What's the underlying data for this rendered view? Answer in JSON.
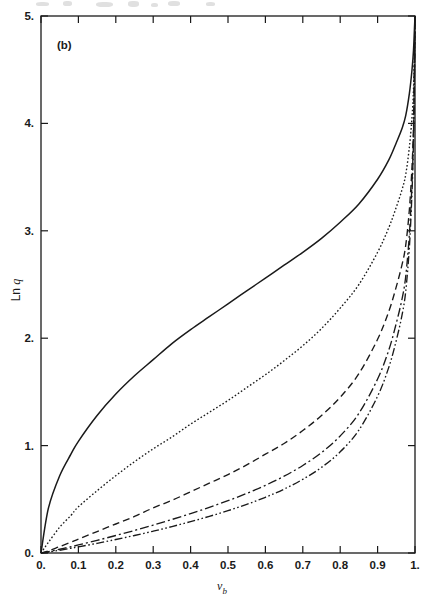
{
  "figure": {
    "panel_label": "(b)",
    "background_color": "#ffffff",
    "line_color": "#1a1a1a",
    "frame": {
      "left": 41,
      "top": 16,
      "right": 415,
      "bottom": 553
    }
  },
  "chart_data": {
    "type": "line",
    "title": "",
    "panel": "(b)",
    "xlabel": "v_b",
    "xlabel_base": "v",
    "xlabel_sub": "b",
    "ylabel": "Ln q",
    "ylabel_base": "Ln ",
    "ylabel_italic": "q",
    "xlim": [
      0,
      1
    ],
    "ylim": [
      0,
      5
    ],
    "xticks": [
      0,
      0.1,
      0.2,
      0.3,
      0.4,
      0.5,
      0.6,
      0.7,
      0.8,
      0.9,
      1
    ],
    "xticklabels": [
      "0.",
      "0.1",
      "0.2",
      "0.3",
      "0.4",
      "0.5",
      "0.6",
      "0.7",
      "0.8",
      "0.9",
      "1."
    ],
    "yticks": [
      0,
      1,
      2,
      3,
      4,
      5
    ],
    "yticklabels": [
      "0.",
      "1.",
      "2.",
      "3.",
      "4.",
      "5."
    ],
    "grid": false,
    "legend": "none",
    "ticks_direction": "in",
    "ticks_on": [
      "left",
      "bottom",
      "top",
      "right"
    ],
    "x": [
      0,
      0.02,
      0.05,
      0.08,
      0.1,
      0.15,
      0.2,
      0.25,
      0.3,
      0.35,
      0.4,
      0.45,
      0.5,
      0.55,
      0.6,
      0.65,
      0.7,
      0.75,
      0.8,
      0.85,
      0.9,
      0.93,
      0.95,
      0.965,
      0.975,
      0.985,
      0.992,
      0.996,
      0.999,
      1
    ],
    "series": [
      {
        "name": "curve-1",
        "style": "solid",
        "dasharray": "none",
        "values": [
          0,
          0.42,
          0.72,
          0.92,
          1.04,
          1.28,
          1.48,
          1.65,
          1.8,
          1.95,
          2.08,
          2.2,
          2.32,
          2.44,
          2.56,
          2.68,
          2.8,
          2.93,
          3.08,
          3.25,
          3.48,
          3.66,
          3.82,
          3.95,
          4.07,
          4.28,
          4.5,
          4.68,
          4.92,
          5
        ]
      },
      {
        "name": "curve-2",
        "style": "dotted",
        "dasharray": "1.6 2.1",
        "values": [
          0,
          0.1,
          0.24,
          0.35,
          0.43,
          0.58,
          0.72,
          0.85,
          0.97,
          1.08,
          1.2,
          1.31,
          1.42,
          1.54,
          1.66,
          1.79,
          1.93,
          2.09,
          2.28,
          2.5,
          2.8,
          3.03,
          3.22,
          3.38,
          3.52,
          3.78,
          4.06,
          4.32,
          4.75,
          5
        ]
      },
      {
        "name": "curve-3",
        "style": "dashed",
        "dasharray": "7 4",
        "values": [
          0,
          0.02,
          0.06,
          0.1,
          0.13,
          0.2,
          0.27,
          0.34,
          0.42,
          0.49,
          0.57,
          0.65,
          0.73,
          0.82,
          0.92,
          1.02,
          1.14,
          1.28,
          1.45,
          1.67,
          1.99,
          2.25,
          2.48,
          2.68,
          2.86,
          3.2,
          3.6,
          3.98,
          4.65,
          5
        ]
      },
      {
        "name": "curve-4",
        "style": "dash-dot",
        "dasharray": "9 3 2 3",
        "values": [
          0,
          0.012,
          0.035,
          0.058,
          0.075,
          0.118,
          0.163,
          0.21,
          0.26,
          0.312,
          0.367,
          0.425,
          0.487,
          0.555,
          0.63,
          0.715,
          0.815,
          0.935,
          1.09,
          1.3,
          1.62,
          1.89,
          2.14,
          2.36,
          2.57,
          2.97,
          3.45,
          3.9,
          4.62,
          5
        ]
      },
      {
        "name": "curve-5",
        "style": "dash-dot-dot",
        "dasharray": "8 2.5 1.6 2.5 1.6 2.5",
        "values": [
          0,
          0.009,
          0.026,
          0.044,
          0.057,
          0.09,
          0.126,
          0.163,
          0.203,
          0.246,
          0.292,
          0.341,
          0.394,
          0.453,
          0.519,
          0.595,
          0.686,
          0.797,
          0.942,
          1.145,
          1.46,
          1.73,
          1.98,
          2.21,
          2.43,
          2.85,
          3.36,
          3.85,
          4.6,
          5
        ]
      }
    ]
  }
}
